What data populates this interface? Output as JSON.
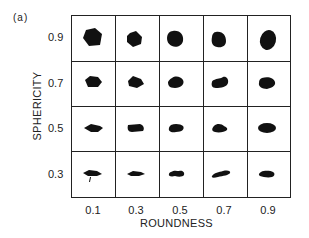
{
  "panel_label": "(a)",
  "axes": {
    "xlabel": "ROUNDNESS",
    "ylabel": "SPHERICITY",
    "x_ticks": [
      "0.1",
      "0.3",
      "0.5",
      "0.7",
      "0.9"
    ],
    "y_ticks": [
      "0.9",
      "0.7",
      "0.5",
      "0.3"
    ]
  },
  "grid": {
    "rows": 4,
    "cols": 5,
    "description": "Visual comparison chart of particle shapes: black silhouettes arranged by sphericity (rows) and roundness (columns)"
  },
  "colors": {
    "ink": "#111111",
    "background": "#ffffff"
  }
}
